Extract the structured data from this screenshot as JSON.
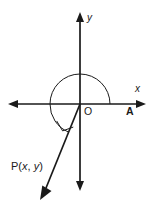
{
  "figure": {
    "kind": "coordinate-plane-angle-diagram",
    "background_color": "#ffffff",
    "line_color": "#1a1a1a",
    "labels": {
      "y_axis": "y",
      "x_axis": "x",
      "origin": "O",
      "point_a": "A",
      "point_p_prefix": "P(",
      "point_p_x": "x",
      "point_p_comma": ", ",
      "point_p_y": "y",
      "point_p_suffix": ")"
    },
    "geometry": {
      "origin_x": 80,
      "origin_y": 104,
      "x_axis_left_tip": 8,
      "x_axis_right_tip": 146,
      "y_axis_top_tip": 12,
      "y_axis_bottom_tip": 191,
      "arc_radius": 30,
      "arc_start_angle_deg": 0,
      "arc_end_angle_deg": 248,
      "arc_direction": "counterclockwise",
      "ray_tip_x": 40,
      "ray_tip_y": 200,
      "ray_angle_deg": 248
    }
  }
}
